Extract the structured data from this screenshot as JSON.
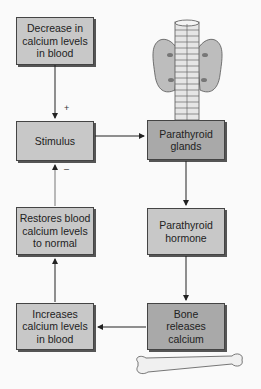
{
  "diagram": {
    "nodes": [
      {
        "id": "decrease",
        "label": "Decrease in calcium levels in blood",
        "shade": "light"
      },
      {
        "id": "stimulus",
        "label": "Stimulus",
        "shade": "light"
      },
      {
        "id": "glands",
        "label": "Parathyroid glands",
        "shade": "dark"
      },
      {
        "id": "hormone",
        "label": "Parathyroid hormone",
        "shade": "light"
      },
      {
        "id": "bone",
        "label": "Bone releases calcium",
        "shade": "dark"
      },
      {
        "id": "increases",
        "label": "Increases calcium levels in blood",
        "shade": "light"
      },
      {
        "id": "restores",
        "label": "Restores blood calcium levels to normal",
        "shade": "light"
      }
    ],
    "edges": [
      {
        "from": "decrease",
        "to": "stimulus",
        "sign": "+"
      },
      {
        "from": "stimulus",
        "to": "glands"
      },
      {
        "from": "glands",
        "to": "hormone"
      },
      {
        "from": "hormone",
        "to": "bone"
      },
      {
        "from": "bone",
        "to": "increases"
      },
      {
        "from": "increases",
        "to": "restores"
      },
      {
        "from": "restores",
        "to": "stimulus",
        "sign": "–"
      }
    ],
    "signs": {
      "plus": "+",
      "minus": "–"
    },
    "illustrations": [
      "parathyroid-thyroid-trachea-illustration",
      "bone-illustration"
    ]
  }
}
